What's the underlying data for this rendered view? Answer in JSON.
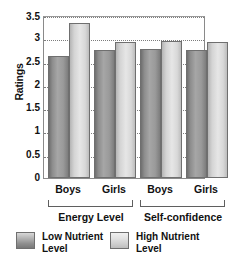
{
  "chart_data": {
    "type": "bar",
    "title": "",
    "subtitle": "",
    "xlabel": "",
    "ylabel": "Ratings",
    "ylim": [
      0,
      3.5
    ],
    "yticks": [
      "0",
      "0.5",
      "1",
      "1.5",
      "2",
      "2.5",
      "3",
      "3.5"
    ],
    "ytick_values": [
      0,
      0.5,
      1,
      1.5,
      2,
      2.5,
      3,
      3.5
    ],
    "grid": "horizontal-dotted",
    "legend_position": "bottom",
    "categories": [
      "Boys",
      "Girls",
      "Boys",
      "Girls"
    ],
    "group_labels": [
      "Energy Level",
      "Self-confidence"
    ],
    "series": [
      {
        "name": "Low Nutrient Level",
        "values": [
          2.63,
          2.75,
          2.76,
          2.75
        ],
        "color": "#9a9a9a"
      },
      {
        "name": "High Nutrient Level",
        "values": [
          3.32,
          2.93,
          2.94,
          2.93
        ],
        "color": "#dcdcdc"
      }
    ],
    "groups": [
      {
        "label": "Energy Level",
        "bars": [
          {
            "category": "Boys",
            "series": "Low Nutrient Level",
            "value": 2.63
          },
          {
            "category": "Boys",
            "series": "High Nutrient Level",
            "value": 3.32
          },
          {
            "category": "Girls",
            "series": "Low Nutrient Level",
            "value": 2.75
          },
          {
            "category": "Girls",
            "series": "High Nutrient Level",
            "value": 2.93
          }
        ]
      },
      {
        "label": "Self-confidence",
        "bars": [
          {
            "category": "Boys",
            "series": "Low Nutrient Level",
            "value": 2.76
          },
          {
            "category": "Boys",
            "series": "High Nutrient Level",
            "value": 2.94
          },
          {
            "category": "Girls",
            "series": "Low Nutrient Level",
            "value": 2.75
          },
          {
            "category": "Girls",
            "series": "High Nutrient Level",
            "value": 2.93
          }
        ]
      }
    ]
  },
  "axis": {
    "y_title": "Ratings",
    "tick_0": "0",
    "tick_1": "0.5",
    "tick_2": "1",
    "tick_3": "1.5",
    "tick_4": "2",
    "tick_5": "2.5",
    "tick_6": "3",
    "tick_7": "3.5"
  },
  "categories": {
    "c0": "Boys",
    "c1": "Girls",
    "c2": "Boys",
    "c3": "Girls"
  },
  "groups": {
    "g0": "Energy Level",
    "g1": "Self-confidence"
  },
  "legend": {
    "items": [
      {
        "label_line1": "Low Nutrient",
        "label_line2": "Level",
        "key": "low"
      },
      {
        "label_line1": "High Nutrient",
        "label_line2": "Level",
        "key": "high"
      }
    ],
    "low_line1": "Low Nutrient",
    "low_line2": "Level",
    "high_line1": "High Nutrient",
    "high_line2": "Level"
  }
}
